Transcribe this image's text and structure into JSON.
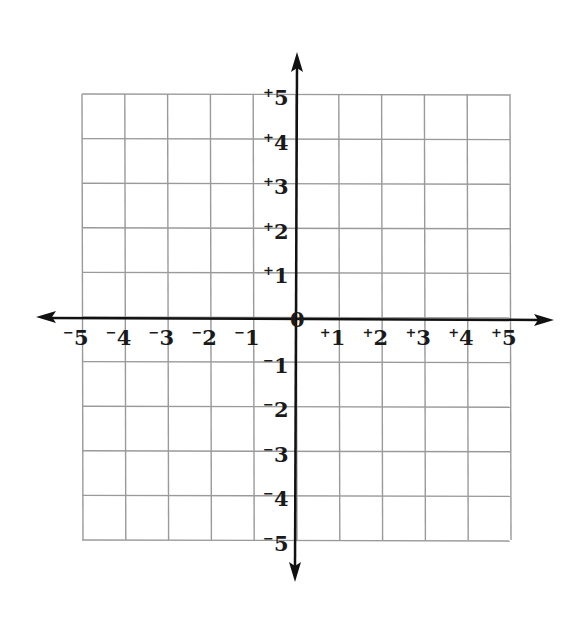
{
  "diagram": {
    "type": "coordinate-plane",
    "x_range": [
      -5,
      5
    ],
    "y_range": [
      -5,
      5
    ],
    "grid": true,
    "colors": {
      "grid": "#9a9a9a",
      "axis": "#111111",
      "label": "#1a1a1a",
      "background": "#ffffff"
    },
    "origin_label": "0",
    "x_labels": [
      {
        "value": -5,
        "sign": "−",
        "num": "5"
      },
      {
        "value": -4,
        "sign": "−",
        "num": "4"
      },
      {
        "value": -3,
        "sign": "−",
        "num": "3"
      },
      {
        "value": -2,
        "sign": "−",
        "num": "2"
      },
      {
        "value": -1,
        "sign": "−",
        "num": "1"
      },
      {
        "value": 1,
        "sign": "+",
        "num": "1"
      },
      {
        "value": 2,
        "sign": "+",
        "num": "2"
      },
      {
        "value": 3,
        "sign": "+",
        "num": "3"
      },
      {
        "value": 4,
        "sign": "+",
        "num": "4"
      },
      {
        "value": 5,
        "sign": "+",
        "num": "5"
      }
    ],
    "y_labels": [
      {
        "value": 5,
        "sign": "+",
        "num": "5"
      },
      {
        "value": 4,
        "sign": "+",
        "num": "4"
      },
      {
        "value": 3,
        "sign": "+",
        "num": "3"
      },
      {
        "value": 2,
        "sign": "+",
        "num": "2"
      },
      {
        "value": 1,
        "sign": "+",
        "num": "1"
      },
      {
        "value": -1,
        "sign": "−",
        "num": "1"
      },
      {
        "value": -2,
        "sign": "−",
        "num": "2"
      },
      {
        "value": -3,
        "sign": "−",
        "num": "3"
      },
      {
        "value": -4,
        "sign": "−",
        "num": "4"
      },
      {
        "value": -5,
        "sign": "−",
        "num": "5"
      }
    ]
  }
}
